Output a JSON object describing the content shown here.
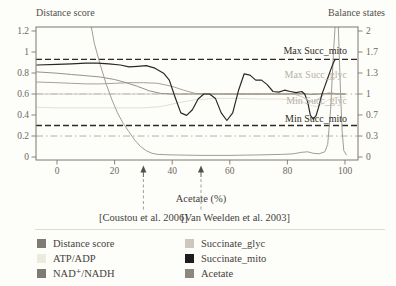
{
  "figure_title_left": "Distance score",
  "figure_title_right": "Balance states",
  "chart_data": {
    "type": "line",
    "title": "",
    "xlabel": "Acetate (%)",
    "x_axis": {
      "range": [
        -7.3,
        104.5
      ],
      "ticks": [
        {
          "v": 0,
          "label": "0"
        },
        {
          "v": 20,
          "label": "20"
        },
        {
          "v": 40,
          "label": "40"
        },
        {
          "v": 60,
          "label": "60"
        },
        {
          "v": 80,
          "label": "80"
        },
        {
          "v": 100,
          "label": "100"
        }
      ]
    },
    "y_axis_left": {
      "label": "Distance score",
      "range": [
        0,
        1.2
      ],
      "ticks": [
        {
          "v": 1.2,
          "label": "1.2"
        },
        {
          "v": 1.0,
          "label": "1"
        },
        {
          "v": 0.8,
          "label": "0.8"
        },
        {
          "v": 0.6,
          "label": "0.6"
        },
        {
          "v": 0.4,
          "label": "0.4"
        },
        {
          "v": 0.2,
          "label": "0.2"
        },
        {
          "v": 0.0,
          "label": "0"
        }
      ]
    },
    "y_axis_right": {
      "label": "Balance states",
      "range": [
        0,
        2
      ],
      "ticks": [
        {
          "v": 2.0,
          "label": "2"
        },
        {
          "v": 1.667,
          "label": "1.7"
        },
        {
          "v": 1.333,
          "label": "1.3"
        },
        {
          "v": 1.0,
          "label": "1"
        },
        {
          "v": 0.667,
          "label": "0.7"
        },
        {
          "v": 0.333,
          "label": "0.3"
        },
        {
          "v": 0.0,
          "label": "0"
        }
      ]
    },
    "reference_lines": [
      {
        "name": "max_succ_mito",
        "label": "Max Succ_mito",
        "axis": "right",
        "value": 1.55,
        "style": "dashed",
        "color": "#2e2b26",
        "label_color": "#2e2b26",
        "label_value": 1.63
      },
      {
        "name": "max_succ_glyc",
        "label": "Max Succ_glyc",
        "axis": "right",
        "value": 1.3,
        "style": "none",
        "color": "#b7b1a5",
        "label_color": "#b7b1a5",
        "label_value": 1.25
      },
      {
        "name": "balance_equal_one",
        "label": "",
        "axis": "right",
        "value": 1.0,
        "style": "dashdot",
        "color": "#b7b1a5",
        "label_color": "#b7b1a5",
        "label_value": 1.0
      },
      {
        "name": "min_succ_glyc",
        "label": "Min Succ_glyc",
        "axis": "right",
        "value": 0.88,
        "style": "none",
        "color": "#b7b1a5",
        "label_color": "#b7b1a5",
        "label_value": 0.845
      },
      {
        "name": "min_succ_mito",
        "label": "Min Succ_mito",
        "axis": "right",
        "value": 0.5,
        "style": "dashed",
        "color": "#2e2b26",
        "label_color": "#2e2b26",
        "label_value": 0.55
      },
      {
        "name": "lower_dashdot",
        "label": "",
        "axis": "right",
        "value": 0.333,
        "style": "dashdot",
        "color": "#b7b1a5",
        "label_color": "#b7b1a5",
        "label_value": 0.333
      }
    ],
    "annotations": [
      {
        "x": 30,
        "label": "[Coustou et al. 2006]",
        "label_x": 30
      },
      {
        "x": 50,
        "label": "[Van Weelden et al. 2003]",
        "label_x": 62
      }
    ],
    "series": [
      {
        "name": "ATP/ADP",
        "axis": "right",
        "color": "#e3dfd2",
        "width": 1,
        "points": [
          [
            -7,
            0.79
          ],
          [
            0,
            0.78
          ],
          [
            10,
            0.78
          ],
          [
            20,
            0.78
          ],
          [
            30,
            0.78
          ],
          [
            36,
            0.8
          ],
          [
            42,
            0.86
          ],
          [
            48,
            0.91
          ],
          [
            55,
            0.93
          ],
          [
            62,
            0.93
          ],
          [
            70,
            0.92
          ],
          [
            78,
            0.92
          ],
          [
            83,
            0.9
          ],
          [
            86,
            0.86
          ],
          [
            88,
            0.82
          ],
          [
            90,
            0.8
          ],
          [
            92,
            0.84
          ],
          [
            94,
            0.9
          ],
          [
            96,
            0.94
          ],
          [
            98,
            0.95
          ],
          [
            100,
            0.95
          ]
        ]
      },
      {
        "name": "Succinate_glyc",
        "axis": "right",
        "color": "#cbc6bb",
        "width": 1,
        "points": [
          [
            -7,
            1.0
          ],
          [
            0,
            1.0
          ],
          [
            20,
            1.0
          ],
          [
            40,
            1.0
          ],
          [
            60,
            1.0
          ],
          [
            80,
            1.0
          ],
          [
            82,
            1.0
          ],
          [
            85,
            0.96
          ],
          [
            87,
            0.9
          ],
          [
            89,
            0.88
          ],
          [
            91,
            0.93
          ],
          [
            93,
            1.0
          ],
          [
            95,
            1.03
          ],
          [
            97,
            1.0
          ],
          [
            100,
            1.0
          ]
        ]
      },
      {
        "name": "Acetate",
        "axis": "right",
        "color": "#a8a298",
        "width": 1,
        "points": [
          [
            -7,
            1.19
          ],
          [
            0,
            1.18
          ],
          [
            5,
            1.17
          ],
          [
            10,
            1.16
          ],
          [
            15,
            1.16
          ],
          [
            20,
            1.17
          ],
          [
            25,
            1.18
          ],
          [
            30,
            1.18
          ],
          [
            35,
            1.17
          ],
          [
            40,
            1.12
          ],
          [
            44,
            1.06
          ],
          [
            48,
            1.01
          ],
          [
            52,
            1.0
          ],
          [
            60,
            1.0
          ],
          [
            70,
            1.0
          ],
          [
            80,
            1.0
          ],
          [
            90,
            1.0
          ],
          [
            96,
            1.0
          ],
          [
            100,
            1.0
          ]
        ]
      },
      {
        "name": "NAD+/NADH",
        "axis": "right",
        "color": "#989287",
        "width": 1,
        "points": [
          [
            -7,
            1.35
          ],
          [
            0,
            1.33
          ],
          [
            5,
            1.31
          ],
          [
            10,
            1.29
          ],
          [
            15,
            1.27
          ],
          [
            20,
            1.23
          ],
          [
            24,
            1.18
          ],
          [
            28,
            1.12
          ],
          [
            32,
            1.05
          ],
          [
            36,
            1.01
          ],
          [
            40,
            1.0
          ],
          [
            50,
            1.0
          ],
          [
            60,
            1.0
          ],
          [
            70,
            1.0
          ],
          [
            80,
            1.0
          ],
          [
            85,
            1.01
          ],
          [
            88,
            0.99
          ],
          [
            91,
            1.0
          ],
          [
            94,
            1.01
          ],
          [
            97,
            1.0
          ],
          [
            100,
            1.0
          ]
        ]
      },
      {
        "name": "Distance score",
        "axis": "left",
        "color": "#a39d92",
        "width": 1,
        "points": [
          [
            11.5,
            1.3
          ],
          [
            13,
            1.08
          ],
          [
            15,
            0.88
          ],
          [
            17,
            0.7
          ],
          [
            19,
            0.55
          ],
          [
            21,
            0.42
          ],
          [
            23,
            0.32
          ],
          [
            25,
            0.24
          ],
          [
            27,
            0.16
          ],
          [
            29,
            0.1
          ],
          [
            31,
            0.06
          ],
          [
            33,
            0.035
          ],
          [
            35,
            0.025
          ],
          [
            40,
            0.02
          ],
          [
            50,
            0.015
          ],
          [
            60,
            0.015
          ],
          [
            70,
            0.02
          ],
          [
            78,
            0.025
          ],
          [
            82,
            0.03
          ],
          [
            85,
            0.045
          ],
          [
            87,
            0.05
          ],
          [
            89,
            0.035
          ],
          [
            91,
            0.03
          ],
          [
            93,
            0.05
          ],
          [
            94,
            0.12
          ],
          [
            95,
            0.45
          ],
          [
            96,
            1.0
          ],
          [
            96.8,
            1.35
          ],
          [
            97.6,
            1.3
          ],
          [
            98.4,
            0.65
          ],
          [
            99,
            0.25
          ],
          [
            99.6,
            0.06
          ],
          [
            100.5,
            0.02
          ]
        ]
      },
      {
        "name": "Succinate_mito",
        "axis": "right",
        "color": "#2b2924",
        "width": 1.2,
        "points": [
          [
            -7,
            1.46
          ],
          [
            0,
            1.47
          ],
          [
            5,
            1.48
          ],
          [
            10,
            1.49
          ],
          [
            14,
            1.49
          ],
          [
            18,
            1.48
          ],
          [
            22,
            1.46
          ],
          [
            25,
            1.43
          ],
          [
            28,
            1.44
          ],
          [
            31,
            1.45
          ],
          [
            34,
            1.41
          ],
          [
            37,
            1.33
          ],
          [
            39,
            1.22
          ],
          [
            41,
            0.95
          ],
          [
            43,
            0.7
          ],
          [
            45,
            0.66
          ],
          [
            47,
            0.75
          ],
          [
            49,
            0.92
          ],
          [
            51,
            1.0
          ],
          [
            53,
            1.0
          ],
          [
            55,
            0.93
          ],
          [
            57,
            0.7
          ],
          [
            59,
            0.58
          ],
          [
            61,
            0.7
          ],
          [
            63,
            1.05
          ],
          [
            65,
            1.32
          ],
          [
            67,
            1.3
          ],
          [
            69,
            1.22
          ],
          [
            71,
            1.22
          ],
          [
            73,
            1.15
          ],
          [
            75,
            1.04
          ],
          [
            77,
            1.03
          ],
          [
            79,
            1.06
          ],
          [
            81,
            1.04
          ],
          [
            83,
            1.02
          ],
          [
            85,
            1.04
          ],
          [
            86,
            1.0
          ],
          [
            87,
            0.88
          ],
          [
            88,
            0.66
          ],
          [
            89,
            0.6
          ],
          [
            90,
            0.66
          ],
          [
            91,
            0.82
          ],
          [
            92,
            1.0
          ],
          [
            93,
            1.12
          ],
          [
            94,
            1.25
          ],
          [
            95,
            1.38
          ],
          [
            96,
            1.5
          ],
          [
            96.5,
            1.54
          ]
        ]
      }
    ]
  },
  "legend": {
    "columns": [
      [
        {
          "label": "Distance score",
          "color": "#807b72"
        },
        {
          "label": "ATP/ADP",
          "color": "#ecebe0"
        },
        {
          "label": "NAD⁺/NADH",
          "color": "#807b72"
        }
      ],
      [
        {
          "label": "Succinate_glyc",
          "color": "#cdc8be"
        },
        {
          "label": "Succinate_mito",
          "color": "#1e1d1b"
        },
        {
          "label": "Acetate",
          "color": "#8d887f"
        }
      ]
    ]
  }
}
